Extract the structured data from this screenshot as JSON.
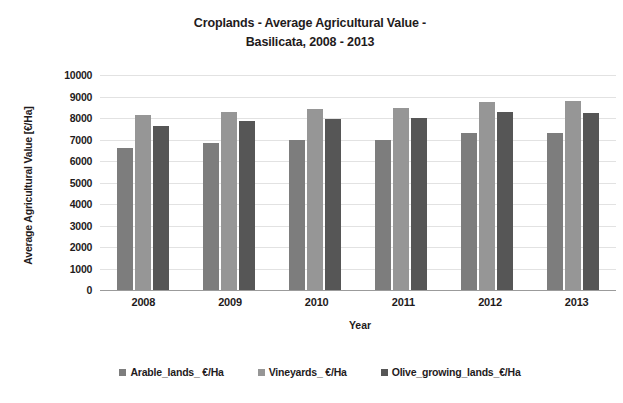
{
  "chart_data": {
    "type": "bar",
    "title": "Croplands - Average Agricultural Value - Basilicata, 2008 - 2013",
    "title_lines": [
      "Croplands - Average Agricultural Value -",
      "Basilicata, 2008 - 2013"
    ],
    "xlabel": "Year",
    "ylabel": "Average Agricultural Value [€/Ha]",
    "categories": [
      "2008",
      "2009",
      "2010",
      "2011",
      "2012",
      "2013"
    ],
    "ylim": [
      0,
      10000
    ],
    "ytick_labels": [
      "10000",
      "9000",
      "8000",
      "7000",
      "6000",
      "5000",
      "4000",
      "3000",
      "2000",
      "1000",
      "0"
    ],
    "ytick_values": [
      10000,
      9000,
      8000,
      7000,
      6000,
      5000,
      4000,
      3000,
      2000,
      1000,
      0
    ],
    "grid": true,
    "legend_position": "bottom",
    "series": [
      {
        "name": "Arable_lands_ €/Ha",
        "color": "#7d7d7d",
        "values": [
          6600,
          6850,
          7000,
          7000,
          7300,
          7300
        ]
      },
      {
        "name": "Vineyards_ €/Ha",
        "color": "#969696",
        "values": [
          8150,
          8300,
          8400,
          8450,
          8750,
          8800
        ]
      },
      {
        "name": "Olive_growing_lands_€/Ha",
        "color": "#565656",
        "values": [
          7650,
          7850,
          7950,
          7980,
          8300,
          8250
        ]
      }
    ]
  }
}
